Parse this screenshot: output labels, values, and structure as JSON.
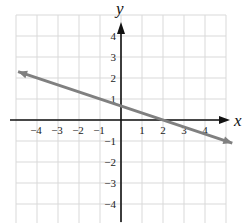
{
  "chart_data": {
    "type": "line",
    "title": "",
    "xlabel": "x",
    "ylabel": "y",
    "xlim": [
      -5,
      5
    ],
    "ylim": [
      -5,
      5
    ],
    "grid": true,
    "x_ticks": [
      -4,
      -3,
      -2,
      -1,
      1,
      2,
      3,
      4
    ],
    "y_ticks": [
      4,
      3,
      2,
      1,
      -1,
      -2,
      -3,
      -4
    ],
    "x_tick_labels": [
      "−4",
      "−3",
      "−2",
      "−1",
      "1",
      "2",
      "3",
      "4"
    ],
    "y_tick_labels": [
      "4",
      "3",
      "2",
      "1",
      "−1",
      "−2",
      "−3",
      "−4"
    ],
    "series": [
      {
        "name": "line",
        "equation": "y = -x/3 + 2/3",
        "x": [
          -5,
          0,
          2,
          5
        ],
        "y": [
          2.33,
          0.67,
          0,
          -1.33
        ],
        "arrows": "both",
        "color": "#808080"
      }
    ]
  },
  "colors": {
    "grid": "#d9d9d9",
    "axis": "#111111",
    "line": "#808080"
  }
}
